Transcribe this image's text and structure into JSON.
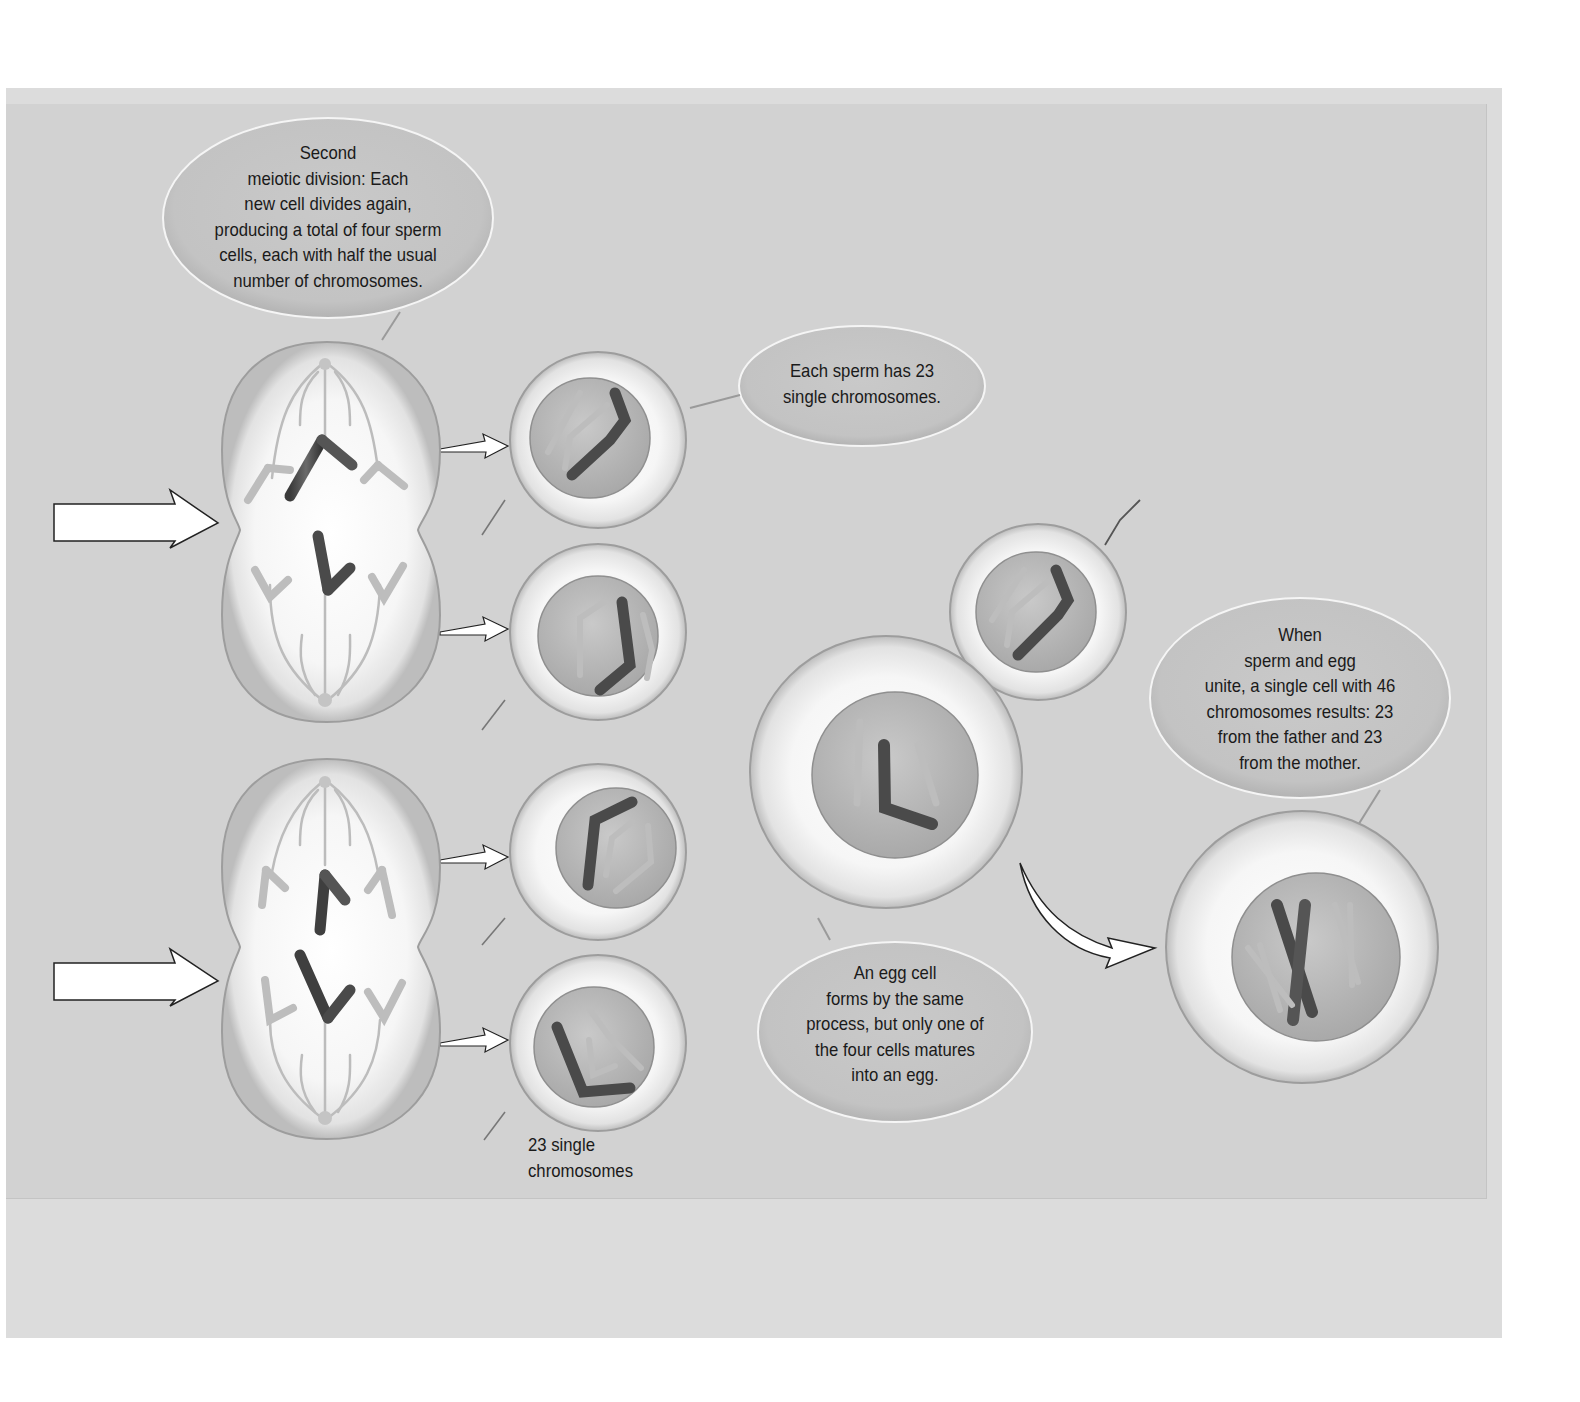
{
  "colors": {
    "page_background": "#ffffff",
    "panel_background": "#d2d2d2",
    "panel_band": "#dcdcdc",
    "cell_membrane": "#f4f4f4",
    "nucleus": "#b9b9b9",
    "chromosome_dark": "#4a4a4a",
    "chromosome_light": "#bdbdbd",
    "spindle": "#bcbcbc",
    "bubble_fill": "#c6c6c6",
    "text": "#1a1a1a"
  },
  "callouts": {
    "second_division": {
      "lines": [
        "Second",
        "meiotic division: Each",
        "new cell divides again,",
        "producing a total of four sperm",
        "cells, each with half the usual",
        "number of chromosomes."
      ]
    },
    "sperm_23": {
      "lines": [
        "Each sperm has 23",
        "single chromosomes."
      ]
    },
    "fertilization": {
      "lines": [
        "When",
        "sperm and egg",
        "unite, a single cell with 46",
        "chromosomes results: 23",
        "from the father and 23",
        "from the mother."
      ]
    },
    "egg_cell": {
      "lines": [
        "An egg cell",
        "forms by the same",
        "process, but only one of",
        "the four cells matures",
        "into an egg."
      ]
    }
  },
  "labels": {
    "single_chromosomes": [
      "23 single",
      "chromosomes"
    ]
  },
  "figure": {
    "dividing_cells": [
      {
        "id": "dividing-cell-top",
        "cx": 327,
        "top": 340,
        "bottom": 720
      },
      {
        "id": "dividing-cell-bottom",
        "cx": 327,
        "top": 757,
        "bottom": 1138
      }
    ],
    "sperm_cells": [
      {
        "id": "sperm-cell-1",
        "cx": 598,
        "cy": 440,
        "r": 88
      },
      {
        "id": "sperm-cell-2",
        "cx": 598,
        "cy": 632,
        "r": 88
      },
      {
        "id": "sperm-cell-3",
        "cx": 598,
        "cy": 852,
        "r": 88
      },
      {
        "id": "sperm-cell-4",
        "cx": 598,
        "cy": 1043,
        "r": 88
      },
      {
        "id": "sperm-cell-fertilizing",
        "cx": 1038,
        "cy": 612,
        "r": 88
      }
    ],
    "egg_cell": {
      "id": "egg-cell",
      "cx": 886,
      "cy": 772,
      "r": 136
    },
    "zygote": {
      "id": "zygote-cell",
      "cx": 1302,
      "cy": 947,
      "r": 136
    }
  }
}
